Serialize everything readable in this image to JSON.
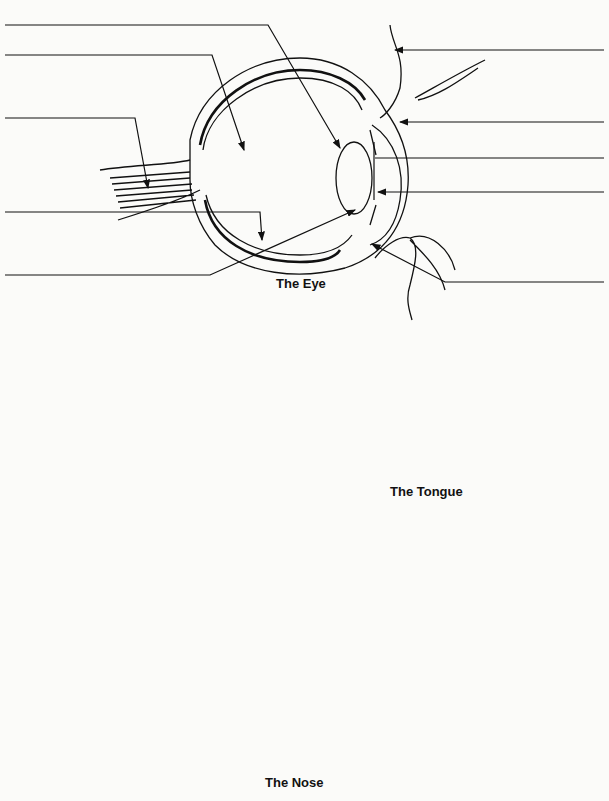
{
  "worksheet": {
    "sections": [
      {
        "id": "eye",
        "caption": "The Eye",
        "label_blanks": 10
      },
      {
        "id": "tongue",
        "caption": "The Tongue",
        "label_blanks": 4
      },
      {
        "id": "nose",
        "caption": "The Nose",
        "label_blanks": 4
      }
    ],
    "colors": {
      "ink": "#111111",
      "paper": "#fbfbf9",
      "stipple": "#333333"
    }
  }
}
